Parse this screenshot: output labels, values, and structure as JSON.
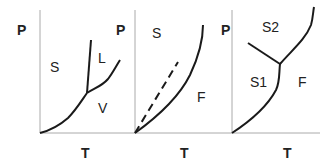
{
  "panels": [
    {
      "ylabel": "P",
      "xlabel": "T",
      "regions": [
        "S",
        "L",
        "V"
      ]
    },
    {
      "ylabel": "P",
      "xlabel": "T",
      "regions": [
        "S",
        "F"
      ]
    },
    {
      "ylabel": "P",
      "xlabel": "T",
      "regions": [
        "S2",
        "S1",
        "F"
      ]
    }
  ],
  "colors": {
    "line": "#1a1a1a",
    "axis": "#999999",
    "text": "#222222"
  }
}
